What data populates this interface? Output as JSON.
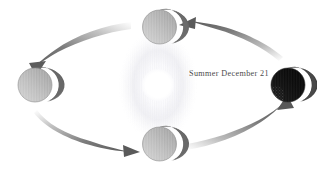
{
  "diagram": {
    "background_color": "#ffffff",
    "width": 317,
    "height": 172,
    "sun": {
      "name": "sun",
      "center_x": 158,
      "center_y": 85,
      "radius": 16,
      "color": "#ffffff",
      "glow_color": "#ededf2"
    },
    "labels": [
      {
        "id": "summer-december-21",
        "text": "Summer December 21",
        "x": 189,
        "y": 70,
        "color": "#4b4b4b"
      }
    ],
    "earths": [
      {
        "id": "earth-top",
        "position": "top",
        "center_x": 159.5,
        "center_y": 27,
        "radius": 17,
        "lit_color": "#b9b9b9",
        "dark_color": "#6e6e6e",
        "outline_color": "#8a8a8a"
      },
      {
        "id": "earth-left",
        "position": "left",
        "center_x": 35,
        "center_y": 85,
        "radius": 17,
        "lit_color": "#bdbdbd",
        "dark_color": "#6a6a6a",
        "outline_color": "#8a8a8a"
      },
      {
        "id": "earth-bottom",
        "position": "bottom",
        "center_x": 159.5,
        "center_y": 144,
        "radius": 17,
        "lit_color": "#bdbdbd",
        "dark_color": "#6b6b6b",
        "outline_color": "#8a8a8a"
      },
      {
        "id": "earth-right",
        "position": "right",
        "center_x": 288,
        "center_y": 85,
        "radius": 17,
        "lit_color": "#4a4a4a",
        "dark_color": "#0d0d0d",
        "outline_color": "#2a2a2a"
      }
    ],
    "arrows": [
      {
        "id": "arrow-top-left",
        "direction": "counterclockwise",
        "from": "top-sphere",
        "to": "left-sphere",
        "color": "#6f6f6f"
      },
      {
        "id": "arrow-top-right",
        "direction": "counterclockwise",
        "from": "right-sphere",
        "to": "top-sphere",
        "color": "#6f6f6f"
      },
      {
        "id": "arrow-bottom-left",
        "direction": "counterclockwise",
        "from": "left-sphere",
        "to": "bottom-sphere",
        "color": "#6f6f6f"
      },
      {
        "id": "arrow-bottom-right",
        "direction": "counterclockwise",
        "from": "bottom-sphere",
        "to": "right-sphere",
        "color": "#6f6f6f"
      }
    ]
  }
}
